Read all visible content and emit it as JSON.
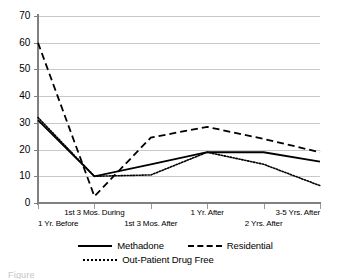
{
  "chart_data": {
    "type": "line",
    "title": "",
    "xlabel": "",
    "ylabel": "",
    "ylim": [
      0,
      70
    ],
    "yticks": [
      0,
      10,
      20,
      30,
      40,
      50,
      60,
      70
    ],
    "grid": true,
    "legend_position": "bottom",
    "categories": [
      "1 Yr. Before",
      "1st 3 Mos. During",
      "1st 3 Mos. After",
      "1 Yr. After",
      "2 Yrs. After",
      "3-5 Yrs. After"
    ],
    "series": [
      {
        "name": "Methadone",
        "style": "solid",
        "values": [
          31,
          10,
          14.5,
          19,
          19,
          15.5
        ]
      },
      {
        "name": "Residential",
        "style": "dashed",
        "values": [
          60,
          2.5,
          24.5,
          28.5,
          24,
          19
        ]
      },
      {
        "name": "Out-Patient Drug Free",
        "style": "dotted",
        "values": [
          32,
          10,
          10.5,
          19,
          14.5,
          6.5
        ]
      }
    ]
  },
  "legend": {
    "items": [
      {
        "label": "Methadone",
        "key": "solid-line-key"
      },
      {
        "label": "Residential",
        "key": "dashed-line-key"
      },
      {
        "label": "Out-Patient Drug Free",
        "key": "dotted-line-key"
      }
    ]
  },
  "caption": {
    "text": "Figure"
  },
  "colors": {
    "line": "#000000",
    "grid": "#c9c9c9",
    "axis": "#808080",
    "background": "#ffffff"
  }
}
